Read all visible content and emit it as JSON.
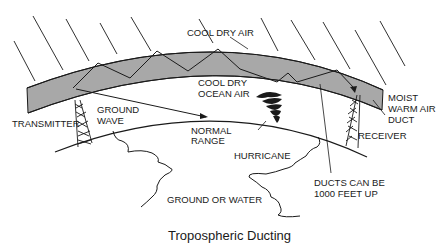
{
  "title": "Tropospheric Ducting",
  "colors": {
    "duct_fill": "#a8a8a8",
    "line": "#1a1a1a",
    "background": "#ffffff"
  },
  "labels": {
    "cool_dry_air": "COOL DRY AIR",
    "cool_dry_ocean_air_1": "COOL DRY",
    "cool_dry_ocean_air_2": "OCEAN AIR",
    "moist_1": "MOIST",
    "moist_2": "WARM AIR",
    "moist_3": "DUCT",
    "transmitter": "TRANSMITTER",
    "ground_wave_1": "GROUND",
    "ground_wave_2": "WAVE",
    "normal_range_1": "NORMAL",
    "normal_range_2": "RANGE",
    "hurricane": "HURRICANE",
    "receiver": "RECEIVER",
    "ducts_1": "DUCTS CAN BE",
    "ducts_2": "1000 FEET UP",
    "ground_or_water": "GROUND OR WATER"
  },
  "icons": {
    "transmitter": "transmitter-tower-icon",
    "receiver": "receiver-tower-icon",
    "hurricane": "hurricane-icon"
  }
}
